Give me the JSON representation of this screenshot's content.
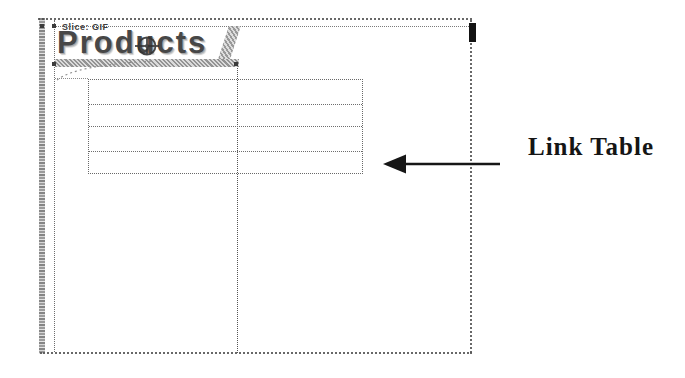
{
  "page": {
    "banner": {
      "slice_label": "Slice: GIF",
      "title": "Products"
    },
    "link_table": {
      "rows": 4,
      "columns": 2,
      "cells_empty": true
    },
    "annotation": {
      "label": "Link Table",
      "arrow_direction": "left"
    },
    "icons": {
      "slice_target": "target-crosshair-icon"
    },
    "colors": {
      "ink": "#1c1c1c",
      "dotted_border": "#6a6a6a",
      "hatch_gray": "#8e8e8e",
      "paper": "#ffffff"
    }
  }
}
